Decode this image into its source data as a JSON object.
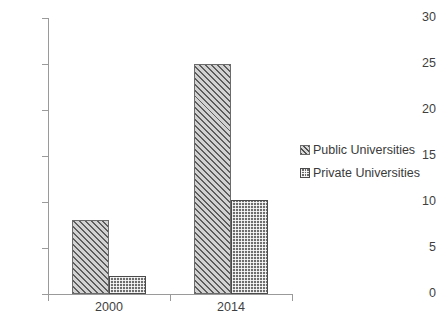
{
  "chart_data": {
    "type": "bar",
    "title": "",
    "title_clipped_note": "",
    "xlabel": "",
    "ylabel": "",
    "categories": [
      "2000",
      "2014"
    ],
    "series": [
      {
        "name": "Public Universities",
        "values": [
          8,
          25
        ],
        "pattern": "diagonal-hatch",
        "color": "#d2d2d2"
      },
      {
        "name": "Private Universities",
        "values": [
          2,
          10.2
        ],
        "pattern": "dotted-checker",
        "color": "#6e6e6e"
      }
    ],
    "ylim": [
      0,
      30
    ],
    "yticks": [
      0,
      5,
      10,
      15,
      20,
      25,
      30
    ],
    "ytick_labels": [
      "0",
      "5",
      "10",
      "15",
      "20",
      "25",
      "30"
    ],
    "grid": false,
    "legend_position": "right-middle"
  },
  "legend": {
    "items": [
      {
        "label": "Public Universities",
        "swatch": "public-swatch-icon"
      },
      {
        "label": "Private Universities",
        "swatch": "private-swatch-icon"
      }
    ]
  }
}
